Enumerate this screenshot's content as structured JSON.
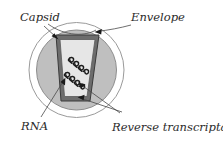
{
  "figure": {
    "background_color": "#ffffff"
  },
  "labels": {
    "capsid": "Capsid",
    "envelope": "Envelope",
    "rna": "RNA",
    "reverse_transcriptase": "Reverse transcriptase"
  },
  "structures": {
    "envelope": {
      "name": "Envelope",
      "shape": "circle",
      "fill_color": "#ffffff",
      "stroke_color": "#9a9a9a"
    },
    "matrix": {
      "name": "Matrix",
      "shape": "circle",
      "fill_color": "#bfbfbf",
      "stroke_color": "#8d8d8d"
    },
    "capsid": {
      "name": "Capsid",
      "shape": "trapezoid",
      "fill_color": "#6d6d6d",
      "stroke_color": "#3a3a3a"
    },
    "capsid_interior": {
      "name": "Capsid interior",
      "shape": "trapezoid",
      "fill_color": "#e6e6e6",
      "stroke_color": "#5a5a5a"
    },
    "rna_strands": {
      "name": "RNA strands",
      "count": 2,
      "stroke_color": "#1c1c1c"
    }
  },
  "leader_lines": {
    "stroke_color": "#4a4a4a",
    "arrowhead_color": "#1a1a1a"
  }
}
